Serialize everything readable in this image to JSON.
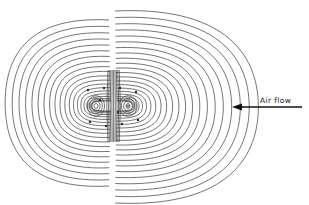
{
  "diagram": {
    "type": "contour-plot",
    "annotation": {
      "label": "Air flow",
      "arrow_direction": "left",
      "icon": "arrow-left-icon"
    },
    "lobes": [
      {
        "name": "left",
        "center": [
          96,
          106
        ],
        "outer_extent": {
          "x": [
            12,
            113
          ],
          "y": [
            22,
            186
          ]
        }
      },
      {
        "name": "right",
        "center": [
          128,
          106
        ],
        "outer_extent": {
          "x": [
            113,
            254
          ],
          "y": [
            14,
            199
          ]
        }
      }
    ],
    "colors": {
      "line": "#3a3a3a",
      "background": "#ffffff"
    }
  }
}
